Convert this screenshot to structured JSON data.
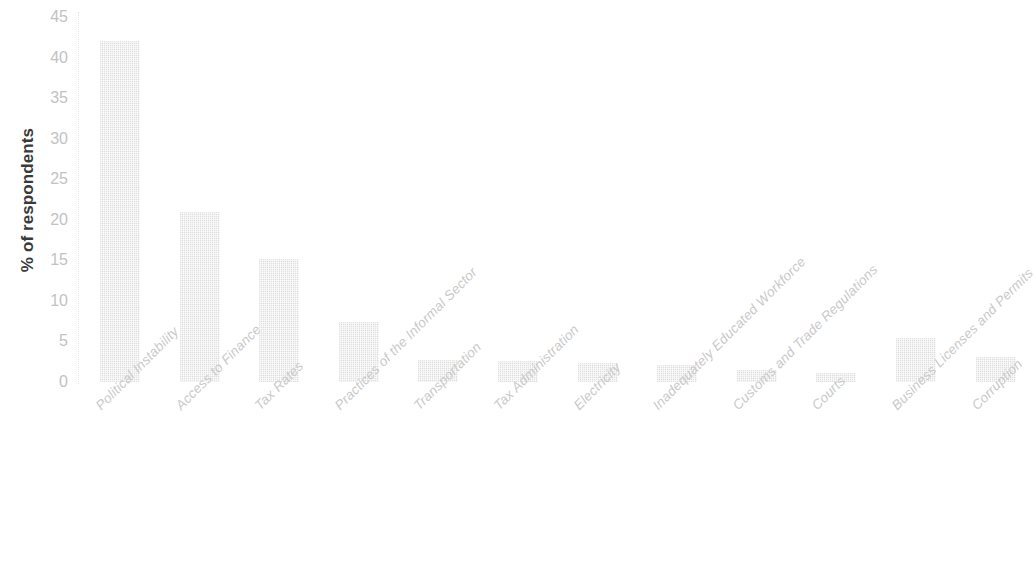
{
  "chart_data": {
    "type": "bar",
    "title": "",
    "xlabel": "",
    "ylabel": "% of respondents",
    "ylim": [
      0,
      45
    ],
    "ytick_step": 5,
    "yticks": [
      "45",
      "40",
      "35",
      "30",
      "25",
      "20",
      "15",
      "10",
      "5",
      "0"
    ],
    "grid": false,
    "legend": "none",
    "orientation": "vertical",
    "bar_color": "#e9e9e9",
    "axis_text_color": "#c2c2c2",
    "axis_title_color": "#3a3a3a",
    "categories": [
      "Political Instability",
      "Access to Finance",
      "Tax Rates",
      "Practices of the Informal Sector",
      "Transportation",
      "Tax Administration",
      "Electricity",
      "Inadequately Educated Workforce",
      "Customs and Trade Regulations",
      "Courts",
      "Business Licenses and Permits",
      "Corruption"
    ],
    "values": [
      42,
      21,
      15.2,
      7.4,
      2.7,
      2.6,
      2.4,
      2.1,
      1.5,
      1.1,
      5.4,
      3.1
    ]
  }
}
